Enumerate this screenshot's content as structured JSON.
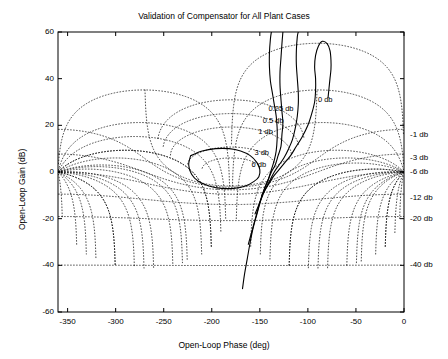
{
  "chart_data": {
    "type": "line",
    "title": "Validation of Compensator for All Plant Cases",
    "xlabel": "Open-Loop Phase (deg)",
    "ylabel": "Open-Loop Gain (dB)",
    "xlim": [
      -360,
      0
    ],
    "ylim": [
      -60,
      60
    ],
    "xticks": [
      -350,
      -300,
      -250,
      -200,
      -150,
      -100,
      -50,
      0
    ],
    "xticklabels": [
      "-350",
      "-300",
      "-250",
      "-200",
      "-150",
      "-100",
      "-50",
      "0"
    ],
    "yticks": [
      -60,
      -40,
      -20,
      0,
      20,
      40,
      60
    ],
    "yticklabels": [
      "-60",
      "-40",
      "-20",
      "0",
      "20",
      "40",
      "60"
    ],
    "grid": "nichols-dotted",
    "legend": "none",
    "line_color": "#000000",
    "grid_color": "#000000",
    "axes_color": "#000000",
    "background": "#ffffff",
    "closed_loop_magnitude_labels": [
      {
        "text": "0 db",
        "phase": -82,
        "gain": 31
      },
      {
        "text": "0.25 db",
        "phase": -128,
        "gain": 27
      },
      {
        "text": "0.5 db",
        "phase": -136,
        "gain": 22
      },
      {
        "text": "1 db",
        "phase": -144,
        "gain": 17
      },
      {
        "text": "3 db",
        "phase": -148,
        "gain": 8
      },
      {
        "text": "6 db",
        "phase": -151,
        "gain": 3
      }
    ],
    "right_axis_magnitude_labels": [
      {
        "text": "-1 db",
        "gain": 16
      },
      {
        "text": "-3 db",
        "gain": 6
      },
      {
        "text": "-6 db",
        "gain": 0
      },
      {
        "text": "-12 db",
        "gain": -11
      },
      {
        "text": "-20 db",
        "gain": -20
      },
      {
        "text": "-40 db",
        "gain": -40
      }
    ],
    "series": [
      {
        "name": "plant-case-1",
        "points": [
          [
            -168,
            -50
          ],
          [
            -166,
            -44
          ],
          [
            -163,
            -37
          ],
          [
            -160,
            -30
          ],
          [
            -157,
            -24
          ],
          [
            -153,
            -18
          ],
          [
            -149,
            -12
          ],
          [
            -145,
            -7
          ],
          [
            -141,
            -3
          ],
          [
            -138,
            1
          ],
          [
            -135,
            5
          ],
          [
            -133,
            9
          ],
          [
            -132,
            14
          ],
          [
            -132,
            19
          ],
          [
            -133,
            24
          ],
          [
            -135,
            29
          ],
          [
            -137,
            34
          ],
          [
            -139,
            39
          ],
          [
            -140,
            45
          ],
          [
            -140,
            51
          ],
          [
            -139,
            57
          ],
          [
            -138,
            60
          ]
        ]
      },
      {
        "name": "plant-case-2",
        "points": [
          [
            -162,
            -31
          ],
          [
            -158,
            -25
          ],
          [
            -154,
            -19
          ],
          [
            -150,
            -13
          ],
          [
            -146,
            -8
          ],
          [
            -142,
            -4
          ],
          [
            -138,
            0
          ],
          [
            -134,
            3
          ],
          [
            -131,
            7
          ],
          [
            -128,
            11
          ],
          [
            -127,
            16
          ],
          [
            -126,
            21
          ],
          [
            -127,
            26
          ],
          [
            -128,
            31
          ],
          [
            -129,
            37
          ],
          [
            -129,
            43
          ],
          [
            -128,
            49
          ],
          [
            -127,
            55
          ],
          [
            -126,
            60
          ]
        ]
      },
      {
        "name": "plant-case-3",
        "points": [
          [
            -155,
            -18
          ],
          [
            -150,
            -13
          ],
          [
            -145,
            -8
          ],
          [
            -140,
            -4
          ],
          [
            -135,
            0
          ],
          [
            -130,
            3
          ],
          [
            -125,
            6
          ],
          [
            -120,
            10
          ],
          [
            -116,
            14
          ],
          [
            -113,
            19
          ],
          [
            -111,
            24
          ],
          [
            -110,
            29
          ],
          [
            -110,
            34
          ],
          [
            -111,
            40
          ],
          [
            -112,
            46
          ],
          [
            -112,
            52
          ],
          [
            -111,
            58
          ],
          [
            -110,
            60
          ]
        ]
      },
      {
        "name": "plant-case-4",
        "points": [
          [
            -148,
            -10
          ],
          [
            -142,
            -6
          ],
          [
            -136,
            -2
          ],
          [
            -130,
            1
          ],
          [
            -124,
            4
          ],
          [
            -118,
            7
          ],
          [
            -112,
            11
          ],
          [
            -106,
            15
          ],
          [
            -100,
            20
          ],
          [
            -96,
            25
          ],
          [
            -93,
            30
          ],
          [
            -92,
            35
          ],
          [
            -92,
            40
          ],
          [
            -93,
            45
          ],
          [
            -92,
            50
          ],
          [
            -89,
            54
          ],
          [
            -85,
            56
          ],
          [
            -80,
            55
          ],
          [
            -77,
            52
          ],
          [
            -76,
            48
          ],
          [
            -76,
            44
          ],
          [
            -77,
            40
          ],
          [
            -78,
            36
          ],
          [
            -79,
            32
          ]
        ]
      },
      {
        "name": "plant-case-5-closed-loop",
        "points": [
          [
            -222,
            7
          ],
          [
            -210,
            9
          ],
          [
            -196,
            10
          ],
          [
            -182,
            10
          ],
          [
            -170,
            9
          ],
          [
            -160,
            7
          ],
          [
            -153,
            4
          ],
          [
            -150,
            1
          ],
          [
            -151,
            -2
          ],
          [
            -156,
            -4
          ],
          [
            -165,
            -6
          ],
          [
            -177,
            -7
          ],
          [
            -190,
            -7
          ],
          [
            -203,
            -6
          ],
          [
            -214,
            -4
          ],
          [
            -221,
            -1
          ],
          [
            -224,
            3
          ],
          [
            -222,
            7
          ]
        ]
      }
    ]
  },
  "axes": {
    "title": "Validation of Compensator for All Plant Cases",
    "xlabel": "Open-Loop Phase (deg)",
    "ylabel": "Open-Loop Gain (dB)"
  }
}
